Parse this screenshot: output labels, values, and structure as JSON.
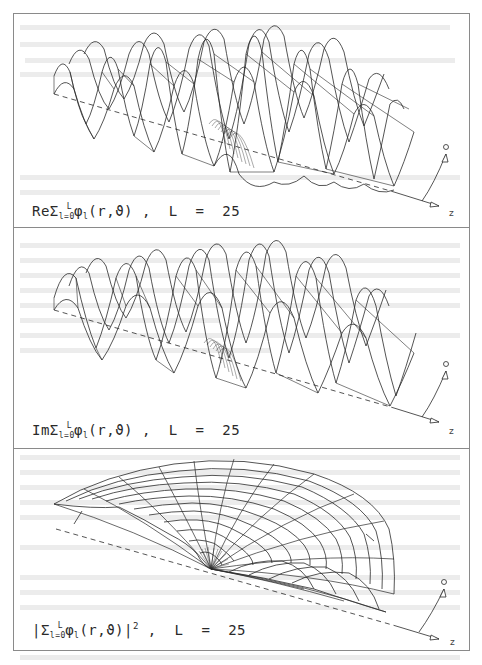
{
  "figure": {
    "panels": [
      {
        "id": "real-part",
        "caption": {
          "prefix": "ReΣ",
          "sum_upper": "L",
          "sum_lower": "l=0",
          "term": "φ",
          "term_sub": "l",
          "args": "(r,ϑ)",
          "suffix": " ,  L  =  25"
        },
        "axes": {
          "z": "z",
          "theta": "ϑ"
        }
      },
      {
        "id": "imaginary-part",
        "caption": {
          "prefix": "ImΣ",
          "sum_upper": "L",
          "sum_lower": "l=0",
          "term": "φ",
          "term_sub": "l",
          "args": "(r,ϑ)",
          "suffix": " ,  L  =  25"
        },
        "axes": {
          "z": "z",
          "theta": "ϑ"
        }
      },
      {
        "id": "modulus-squared",
        "caption": {
          "prefix": "|Σ",
          "sum_upper": "L",
          "sum_lower": "l=0",
          "term": "φ",
          "term_sub": "l",
          "args": "(r,ϑ)|",
          "power": "2",
          "suffix": " ,  L  =  25"
        },
        "axes": {
          "z": "z",
          "theta": "ϑ"
        }
      }
    ],
    "line_color": "#2a2a2a",
    "frame_color": "#8a8a8a",
    "L": 25
  }
}
